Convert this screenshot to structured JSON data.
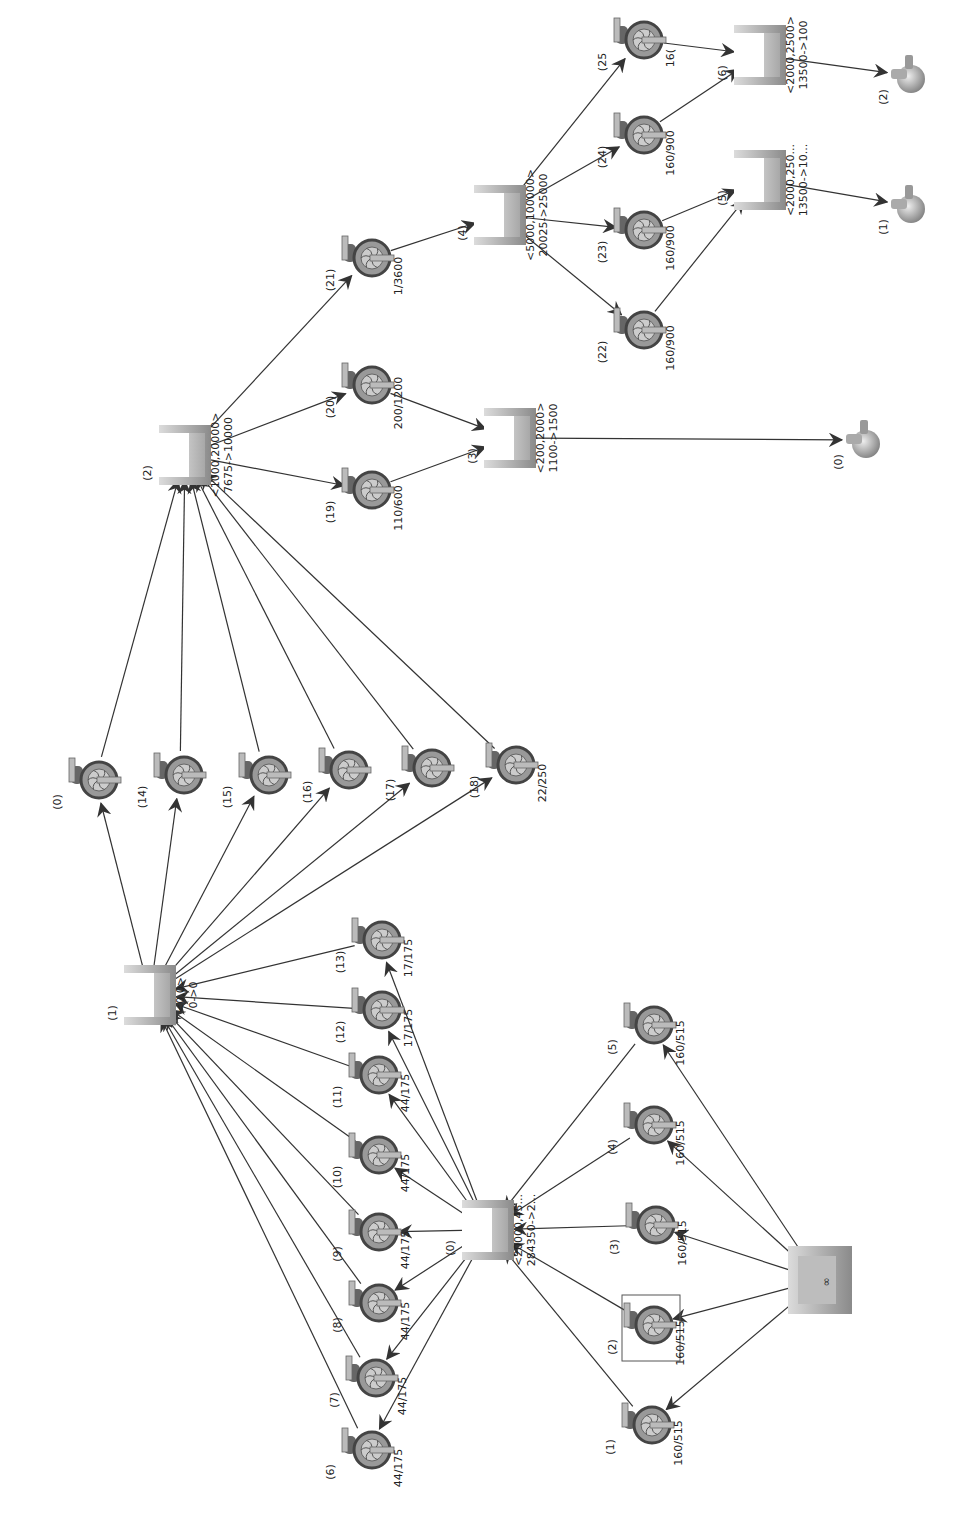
{
  "diagram": {
    "type": "network-flow",
    "orientation": "rotated 90deg clockwise (text reads bottom-to-top)",
    "colors": {
      "edge": "#333333",
      "tank_dark": "#7a7a7a",
      "tank_light": "#c8c8c8",
      "pump": "#555555",
      "background": "#ffffff"
    },
    "tanks": [
      {
        "id": "t0",
        "label": "(0)",
        "range": "<20000,45...",
        "flow": "284350->2...",
        "x": 488,
        "y": 1230
      },
      {
        "id": "t1",
        "label": "(1)",
        "range": "<0,0>",
        "flow": "0->0",
        "x": 150,
        "y": 995
      },
      {
        "id": "t2",
        "label": "(2)",
        "range": "<1000,20000>",
        "flow": "7675->10000",
        "x": 185,
        "y": 455
      },
      {
        "id": "t3",
        "label": "(3)",
        "range": "<200,2000>",
        "flow": "1100->1500",
        "x": 510,
        "y": 438
      },
      {
        "id": "t4",
        "label": "(4)",
        "range": "<5000,100000>",
        "flow": "20025->25000",
        "x": 500,
        "y": 215
      },
      {
        "id": "t5",
        "label": "(5)",
        "range": "<2000,250...",
        "flow": "13500->10...",
        "x": 760,
        "y": 180
      },
      {
        "id": "t6",
        "label": "(6)",
        "range": "<2000,2500>",
        "flow": "13500->100",
        "x": 760,
        "y": 55
      }
    ],
    "source": {
      "id": "src",
      "label": "infinity-source",
      "x": 820,
      "y": 1280
    },
    "sinks": [
      {
        "id": "s0",
        "label": "(0)",
        "x": 860,
        "y": 440
      },
      {
        "id": "s1",
        "label": "(1)",
        "x": 905,
        "y": 205
      },
      {
        "id": "s2",
        "label": "(2)",
        "x": 905,
        "y": 75
      }
    ],
    "pumps": [
      {
        "id": "p1",
        "label": "(1)",
        "value": "160/515",
        "x": 648,
        "y": 1425
      },
      {
        "id": "p2",
        "label": "(2)",
        "value": "160/515",
        "x": 650,
        "y": 1325,
        "selected": true
      },
      {
        "id": "p3",
        "label": "(3)",
        "value": "160/515",
        "x": 652,
        "y": 1225
      },
      {
        "id": "p4",
        "label": "(4)",
        "value": "160/515",
        "x": 650,
        "y": 1125
      },
      {
        "id": "p5",
        "label": "(5)",
        "value": "160/515",
        "x": 650,
        "y": 1025
      },
      {
        "id": "p6",
        "label": "(6)",
        "value": "44/175",
        "x": 368,
        "y": 1450
      },
      {
        "id": "p7",
        "label": "(7)",
        "value": "44/175",
        "x": 372,
        "y": 1378
      },
      {
        "id": "p8",
        "label": "(8)",
        "value": "44/175",
        "x": 375,
        "y": 1303
      },
      {
        "id": "p9",
        "label": "(9)",
        "value": "44/175",
        "x": 375,
        "y": 1232
      },
      {
        "id": "p10",
        "label": "(10)",
        "value": "44/175",
        "x": 375,
        "y": 1155
      },
      {
        "id": "p11",
        "label": "(11)",
        "value": "44/175",
        "x": 375,
        "y": 1075
      },
      {
        "id": "p12",
        "label": "(12)",
        "value": "17/175",
        "x": 378,
        "y": 1010
      },
      {
        "id": "p13",
        "label": "(13)",
        "value": "17/175",
        "x": 378,
        "y": 940
      },
      {
        "id": "p0b",
        "label": "(0)",
        "value": "",
        "x": 95,
        "y": 780
      },
      {
        "id": "p14",
        "label": "(14)",
        "value": "",
        "x": 180,
        "y": 775
      },
      {
        "id": "p15",
        "label": "(15)",
        "value": "",
        "x": 265,
        "y": 775
      },
      {
        "id": "p16",
        "label": "(16)",
        "value": "",
        "x": 345,
        "y": 770
      },
      {
        "id": "p17",
        "label": "(17)",
        "value": "",
        "x": 428,
        "y": 768
      },
      {
        "id": "p18",
        "label": "(18)",
        "value": "22/250",
        "x": 512,
        "y": 765
      },
      {
        "id": "p19",
        "label": "(19)",
        "value": "110/600",
        "x": 368,
        "y": 490
      },
      {
        "id": "p20",
        "label": "(20)",
        "value": "200/1200",
        "x": 368,
        "y": 385
      },
      {
        "id": "p21",
        "label": "(21)",
        "value": "1/3600",
        "x": 368,
        "y": 258
      },
      {
        "id": "p22",
        "label": "(22)",
        "value": "160/900",
        "x": 640,
        "y": 330
      },
      {
        "id": "p23",
        "label": "(23)",
        "value": "160/900",
        "x": 640,
        "y": 230
      },
      {
        "id": "p24",
        "label": "(24)",
        "value": "160/900",
        "x": 640,
        "y": 135
      },
      {
        "id": "p25",
        "label": "(25",
        "value": "16(",
        "x": 640,
        "y": 40
      }
    ],
    "edges": [
      [
        "src",
        "p1"
      ],
      [
        "src",
        "p2"
      ],
      [
        "src",
        "p3"
      ],
      [
        "src",
        "p4"
      ],
      [
        "src",
        "p5"
      ],
      [
        "p1",
        "t0"
      ],
      [
        "p2",
        "t0"
      ],
      [
        "p3",
        "t0"
      ],
      [
        "p4",
        "t0"
      ],
      [
        "p5",
        "t0"
      ],
      [
        "t0",
        "p6"
      ],
      [
        "t0",
        "p7"
      ],
      [
        "t0",
        "p8"
      ],
      [
        "t0",
        "p9"
      ],
      [
        "t0",
        "p10"
      ],
      [
        "t0",
        "p11"
      ],
      [
        "t0",
        "p12"
      ],
      [
        "t0",
        "p13"
      ],
      [
        "p6",
        "t1"
      ],
      [
        "p7",
        "t1"
      ],
      [
        "p8",
        "t1"
      ],
      [
        "p9",
        "t1"
      ],
      [
        "p10",
        "t1"
      ],
      [
        "p11",
        "t1"
      ],
      [
        "p12",
        "t1"
      ],
      [
        "p13",
        "t1"
      ],
      [
        "t1",
        "p0b"
      ],
      [
        "t1",
        "p14"
      ],
      [
        "t1",
        "p15"
      ],
      [
        "t1",
        "p16"
      ],
      [
        "t1",
        "p17"
      ],
      [
        "t1",
        "p18"
      ],
      [
        "p0b",
        "t2"
      ],
      [
        "p14",
        "t2"
      ],
      [
        "p15",
        "t2"
      ],
      [
        "p16",
        "t2"
      ],
      [
        "p17",
        "t2"
      ],
      [
        "p18",
        "t2"
      ],
      [
        "t2",
        "p19"
      ],
      [
        "t2",
        "p20"
      ],
      [
        "t2",
        "p21"
      ],
      [
        "p19",
        "t3"
      ],
      [
        "p20",
        "t3"
      ],
      [
        "t3",
        "s0"
      ],
      [
        "p21",
        "t4"
      ],
      [
        "t4",
        "p22"
      ],
      [
        "t4",
        "p23"
      ],
      [
        "t4",
        "p24"
      ],
      [
        "t4",
        "p25"
      ],
      [
        "p22",
        "t5"
      ],
      [
        "p23",
        "t5"
      ],
      [
        "p24",
        "t6"
      ],
      [
        "p25",
        "t6"
      ],
      [
        "t5",
        "s1"
      ],
      [
        "t6",
        "s2"
      ]
    ]
  }
}
